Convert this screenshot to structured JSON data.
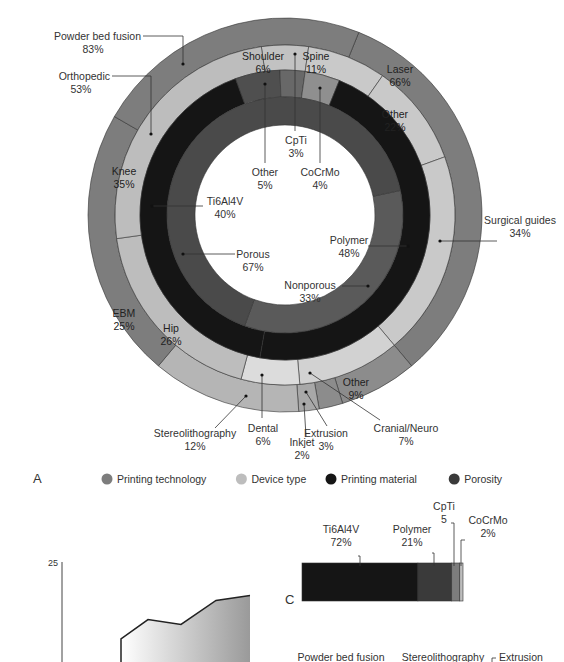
{
  "chart_data": [
    {
      "panel": "A",
      "type": "pie",
      "subtype": "multi-level donut",
      "legend": {
        "placement": "bottom",
        "items": [
          {
            "label": "Printing technology",
            "color": "#7d7d7d"
          },
          {
            "label": "Device type",
            "color": "#bdbdbd"
          },
          {
            "label": "Printing material",
            "color": "#151515"
          },
          {
            "label": "Porosity",
            "color": "#4a4a4a"
          }
        ]
      },
      "rings": [
        {
          "name": "Printing technology",
          "color": "#7d7d7d",
          "segments": [
            {
              "label": "Powder bed fusion",
              "value": 83,
              "pct": "83%"
            },
            {
              "label": "Laser",
              "value": 66,
              "pct": "66%",
              "sub": true
            },
            {
              "label": "EBM",
              "value": 25,
              "pct": "25%",
              "sub": true
            },
            {
              "label": "Other",
              "value": 9,
              "pct": "9%"
            },
            {
              "label": "Extrusion",
              "value": 3,
              "pct": "3%"
            },
            {
              "label": "Inkjet",
              "value": 2,
              "pct": "2%"
            },
            {
              "label": "Stereolithography",
              "value": 12,
              "pct": "12%"
            }
          ]
        },
        {
          "name": "Device type",
          "color": "#bdbdbd",
          "segments": [
            {
              "label": "Orthopedic",
              "value": 53,
              "pct": "53%"
            },
            {
              "label": "Shoulder",
              "value": 6,
              "pct": "6%",
              "sub": true
            },
            {
              "label": "Spine",
              "value": 11,
              "pct": "11%",
              "sub": true
            },
            {
              "label": "Other",
              "value": 22,
              "pct": "22%",
              "sub": true
            },
            {
              "label": "Knee",
              "value": 35,
              "pct": "35%",
              "sub": true
            },
            {
              "label": "Hip",
              "value": 26,
              "pct": "26%",
              "sub": true
            },
            {
              "label": "Surgical guides",
              "value": 34,
              "pct": "34%"
            },
            {
              "label": "Cranial/Neuro",
              "value": 7,
              "pct": "7%"
            },
            {
              "label": "Dental",
              "value": 6,
              "pct": "6%"
            }
          ]
        },
        {
          "name": "Printing material",
          "color": "#151515",
          "segments": [
            {
              "label": "Ti6Al4V",
              "value": 40,
              "pct": "40%"
            },
            {
              "label": "Polymer",
              "value": 48,
              "pct": "48%"
            },
            {
              "label": "Other",
              "value": 5,
              "pct": "5%"
            },
            {
              "label": "CpTi",
              "value": 3,
              "pct": "3%"
            },
            {
              "label": "CoCrMo",
              "value": 4,
              "pct": "4%"
            }
          ]
        },
        {
          "name": "Porosity",
          "color": "#4a4a4a",
          "segments": [
            {
              "label": "Porous",
              "value": 67,
              "pct": "67%"
            },
            {
              "label": "Nonporous",
              "value": 33,
              "pct": "33%"
            }
          ]
        }
      ]
    },
    {
      "panel": "B",
      "type": "area",
      "ytick_labels": [
        "25"
      ],
      "ylim_top": 25,
      "y_values_partial": [
        null,
        9,
        13,
        12,
        17,
        18
      ],
      "note": "Partially visible; lower portion cropped"
    },
    {
      "panel": "C",
      "type": "bar",
      "subtype": "stacked horizontal 100%",
      "segments": [
        {
          "label": "Ti6Al4V",
          "value": 72,
          "pct": "72%",
          "color": "#151515"
        },
        {
          "label": "Polymer",
          "value": 21,
          "pct": "21%",
          "color": "#3a3a3a"
        },
        {
          "label": "CpTi",
          "value": 5,
          "pct": "5",
          "color": "#7d7d7d"
        },
        {
          "label": "CoCrMo",
          "value": 2,
          "pct": "2%",
          "color": "#bdbdbd"
        }
      ],
      "bottom_labels": [
        "Powder bed fusion",
        "Stereolithography",
        "Extrusion"
      ]
    }
  ],
  "panels": {
    "a": "A",
    "c": "C"
  }
}
